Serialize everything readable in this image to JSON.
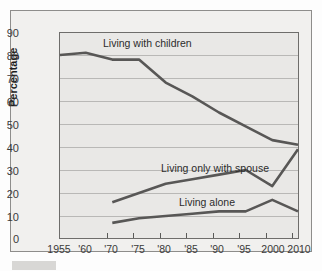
{
  "chart_data": {
    "type": "line",
    "title": "",
    "subtitle": "",
    "xlabel": "",
    "ylabel": "Percentage",
    "ylim": [
      0,
      90
    ],
    "ytick_step": 10,
    "yticks": [
      90,
      80,
      70,
      60,
      50,
      40,
      30,
      20,
      10,
      0
    ],
    "grid": true,
    "legend_position": "inline-annotations",
    "categories": [
      "1955",
      "'60",
      "'70",
      "'75",
      "'80",
      "'85",
      "'90",
      "'95",
      "2000",
      "2010"
    ],
    "series": [
      {
        "name": "Living with children",
        "x": [
          "1955",
          "'60",
          "'70",
          "'75",
          "'80",
          "'85",
          "'90",
          "'95",
          "2000",
          "2010"
        ],
        "values": [
          80,
          81,
          78,
          78,
          68,
          62,
          55,
          49,
          43,
          41
        ]
      },
      {
        "name": "Living only with spouse",
        "x": [
          "'70",
          "'75",
          "'80",
          "'85",
          "'90",
          "'95",
          "2000",
          "2010"
        ],
        "values": [
          16,
          20,
          24,
          26,
          28,
          30,
          23,
          39
        ]
      },
      {
        "name": "Living alone",
        "x": [
          "'70",
          "'75",
          "'80",
          "'85",
          "'90",
          "'95",
          "2000",
          "2010"
        ],
        "values": [
          7,
          9,
          10,
          11,
          12,
          12,
          17,
          12
        ]
      }
    ],
    "annotations": [
      {
        "text": "Living with children",
        "near_series": "Living with children"
      },
      {
        "text": "Living only with spouse",
        "near_series": "Living only with spouse"
      },
      {
        "text": "Living alone",
        "near_series": "Living alone"
      }
    ],
    "colors": {
      "line": "#585756",
      "plot_background": "#e9e8e6",
      "figure_background": "#f1f0ee",
      "gridline": "#b9b8b6",
      "axis": "#6e6d6b",
      "text": "#2c2c2c"
    }
  },
  "axes": {
    "y_title": "Percentage",
    "y_labels": [
      "90",
      "80",
      "70",
      "60",
      "50",
      "40",
      "30",
      "20",
      "10",
      "0"
    ],
    "x_labels": [
      "1955",
      "'60",
      "'70",
      "'75",
      "'80",
      "'85",
      "'90",
      "'95",
      "2000",
      "2010"
    ]
  },
  "labels": {
    "children": "Living with children",
    "spouse": "Living only with spouse",
    "alone": "Living alone"
  }
}
